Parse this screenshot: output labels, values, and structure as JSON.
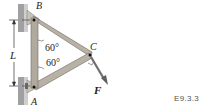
{
  "figure": {
    "points": {
      "A": "A",
      "B": "B",
      "C": "C"
    },
    "dimension": "L",
    "force": "F",
    "angles": [
      "60°",
      "60°"
    ],
    "colors": {
      "wall": "#9a9a9a",
      "member": "#b8b2a6",
      "member_edge": "#6e6a62",
      "force": "#6f6f6f",
      "text": "#222222"
    }
  },
  "example_label": "E9.3.3"
}
